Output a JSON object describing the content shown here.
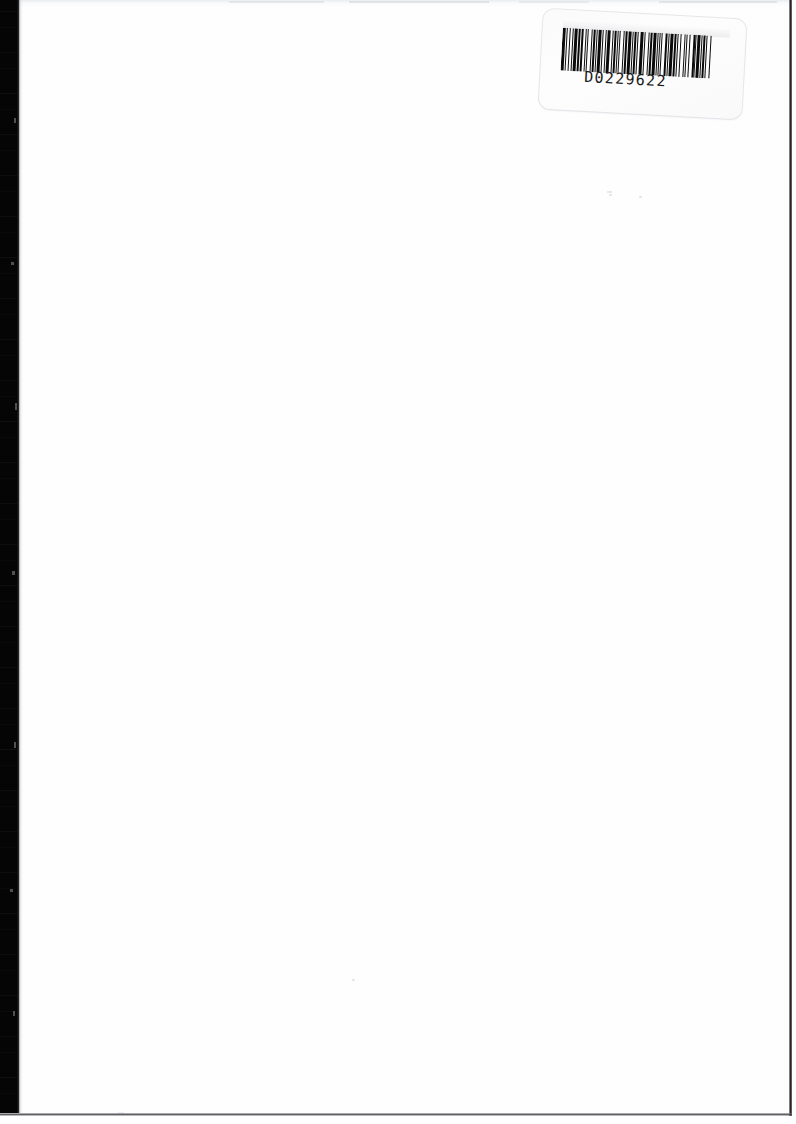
{
  "page": {
    "kind": "scanned-document-page",
    "width": 796,
    "height": 1124,
    "background_color": "#ffffff",
    "body_text": "",
    "body_note": "blank page"
  },
  "gutter": {
    "name": "left-binding-shadow",
    "color": "#050505",
    "width_px": 19
  },
  "edges": {
    "right_rule_color": "#121214",
    "bottom_rule_color": "#46464a"
  },
  "barcode_label": {
    "code_text": "D0229622",
    "symbology": "Code 39",
    "label_color": "#fdfdfd",
    "bar_color": "#0b0b0b",
    "rotation_deg": 3.1,
    "bar_pattern": [
      3,
      1,
      1,
      2,
      1,
      2,
      1,
      1,
      3,
      1,
      2,
      1,
      3,
      2,
      1,
      1,
      1,
      3,
      1,
      1,
      2,
      1,
      1,
      1,
      3,
      1,
      1,
      2,
      1,
      1,
      3,
      2,
      1,
      1,
      2,
      1,
      1,
      1,
      2,
      3,
      1,
      1,
      2,
      1,
      3,
      1,
      1,
      1,
      2,
      1,
      1,
      2,
      3,
      1,
      1,
      3,
      1,
      1,
      2,
      1,
      3,
      1,
      1,
      2,
      1,
      1,
      1,
      3,
      2,
      1,
      1,
      1,
      3,
      1,
      2,
      1,
      1,
      2,
      1,
      3,
      1,
      1,
      1,
      2,
      1,
      3,
      2,
      1,
      1,
      1,
      3,
      1,
      1,
      1,
      2,
      1,
      1,
      3,
      1,
      2
    ]
  }
}
